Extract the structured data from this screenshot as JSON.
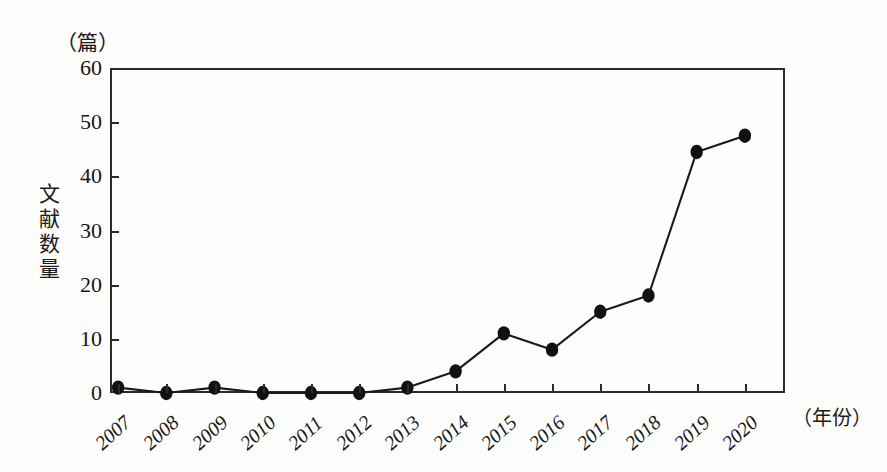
{
  "figure": {
    "y_unit_caption": "（篇）",
    "x_unit_caption": "（年份）",
    "y_axis_title_chars": [
      "文",
      "献",
      "数",
      "量"
    ]
  },
  "chart_data": {
    "type": "line",
    "title": "",
    "subtitle": "",
    "xlabel": "（年份）",
    "ylabel": "文献数量",
    "y_unit": "篇",
    "categories": [
      "2007",
      "2008",
      "2009",
      "2010",
      "2011",
      "2012",
      "2013",
      "2014",
      "2015",
      "2016",
      "2017",
      "2018",
      "2019",
      "2020"
    ],
    "values": [
      1,
      0,
      1,
      0,
      0,
      0,
      1,
      4,
      11,
      8,
      15,
      18,
      44.5,
      47.5
    ],
    "series": [
      {
        "name": "文献数量",
        "values": [
          1,
          0,
          1,
          0,
          0,
          0,
          1,
          4,
          11,
          8,
          15,
          18,
          44.5,
          47.5
        ]
      }
    ],
    "ylim": [
      0,
      60
    ],
    "ytick_labels": [
      "0",
      "10",
      "20",
      "30",
      "40",
      "50",
      "60"
    ],
    "yticks": [
      0,
      10,
      20,
      30,
      40,
      50,
      60
    ],
    "grid": false,
    "legend": "none",
    "marker": "filled-circle",
    "line_color": "#1a1a1a",
    "marker_color": "#111111",
    "frame_color": "#2b2b2b",
    "background_color": "#fdfdfb"
  }
}
